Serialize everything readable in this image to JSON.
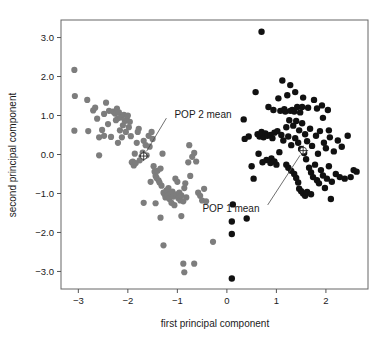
{
  "chart_data": {
    "type": "scatter",
    "title": "",
    "xlabel": "first principal component",
    "ylabel": "second principal component",
    "xlim": [
      -3.35,
      2.85
    ],
    "ylim": [
      -3.45,
      3.45
    ],
    "xticks": [
      -3,
      -2,
      -1,
      0,
      1,
      2
    ],
    "xticklabels": [
      "−3",
      "−2",
      "−1",
      "0",
      "1",
      "2"
    ],
    "yticks": [
      3.0,
      2.0,
      1.0,
      0.0,
      -1.0,
      -2.0,
      -3.0
    ],
    "yticklabels": [
      "3.0",
      "2.0",
      "1.0",
      "0.0",
      "−1.0",
      "−2.0",
      "−3.0"
    ],
    "grid": false,
    "legend": "none",
    "series": [
      {
        "name": "POP 2",
        "color": "#7d7d7d",
        "marker": "filled-circle",
        "marker_size": 4.0,
        "points": [
          [
            -3.08,
            2.17
          ],
          [
            -3.07,
            1.5
          ],
          [
            -3.08,
            0.61
          ],
          [
            -2.82,
            1.4
          ],
          [
            -2.8,
            0.6
          ],
          [
            -2.7,
            1.13
          ],
          [
            -2.66,
            1.2
          ],
          [
            -2.62,
            0.92
          ],
          [
            -2.58,
            0.44
          ],
          [
            -2.52,
            0.63
          ],
          [
            -2.48,
            1.04
          ],
          [
            -2.44,
            1.33
          ],
          [
            -2.4,
            0.78
          ],
          [
            -2.38,
            1.12
          ],
          [
            -2.34,
            0.45
          ],
          [
            -2.3,
            1.1
          ],
          [
            -2.26,
            1.05
          ],
          [
            -2.24,
            0.88
          ],
          [
            -2.22,
            1.18
          ],
          [
            -2.2,
            0.93
          ],
          [
            -2.18,
            1.08
          ],
          [
            -2.16,
            0.62
          ],
          [
            -2.14,
            0.95
          ],
          [
            -2.12,
            0.44
          ],
          [
            -2.1,
            0.75
          ],
          [
            -2.08,
            1.02
          ],
          [
            -2.06,
            0.86
          ],
          [
            -2.04,
            0.58
          ],
          [
            -2.02,
            0.9
          ],
          [
            -2.0,
            1.0
          ],
          [
            -1.98,
            0.7
          ],
          [
            -1.96,
            0.84
          ],
          [
            -1.94,
            0.47
          ],
          [
            -1.92,
            -0.2
          ],
          [
            -1.9,
            -0.18
          ],
          [
            -1.88,
            -0.28
          ],
          [
            -1.86,
            0.02
          ],
          [
            -1.84,
            -0.22
          ],
          [
            -1.82,
            0.3
          ],
          [
            -1.8,
            0.58
          ],
          [
            -1.78,
            0.66
          ],
          [
            -1.76,
            -0.15
          ],
          [
            -1.72,
            -0.05
          ],
          [
            -1.7,
            0.05
          ],
          [
            -1.68,
            0.35
          ],
          [
            -1.64,
            0.24
          ],
          [
            -1.62,
            -0.02
          ],
          [
            -1.58,
            0.48
          ],
          [
            -1.56,
            0.2
          ],
          [
            -1.52,
            0.58
          ],
          [
            -1.5,
            0.4
          ],
          [
            -1.48,
            -0.3
          ],
          [
            -1.46,
            -0.44
          ],
          [
            -1.44,
            -0.55
          ],
          [
            -1.42,
            -0.6
          ],
          [
            -1.4,
            -0.42
          ],
          [
            -1.38,
            -0.66
          ],
          [
            -1.36,
            -0.72
          ],
          [
            -1.34,
            -0.36
          ],
          [
            -1.32,
            -0.8
          ],
          [
            -1.3,
            0.02
          ],
          [
            -1.28,
            -0.98
          ],
          [
            -1.26,
            -1.02
          ],
          [
            -1.24,
            -1.1
          ],
          [
            -1.22,
            -0.92
          ],
          [
            -1.2,
            -1.05
          ],
          [
            -1.18,
            -0.86
          ],
          [
            -1.16,
            -1.14
          ],
          [
            -1.14,
            -1.0
          ],
          [
            -1.12,
            -1.24
          ],
          [
            -1.1,
            -0.95
          ],
          [
            -1.08,
            -1.08
          ],
          [
            -1.06,
            -1.3
          ],
          [
            -1.04,
            -0.62
          ],
          [
            -1.02,
            -1.02
          ],
          [
            -1.0,
            -0.7
          ],
          [
            -0.98,
            -1.12
          ],
          [
            -0.96,
            -0.98
          ],
          [
            -0.94,
            -1.18
          ],
          [
            -0.92,
            -1.05
          ],
          [
            -0.88,
            -1.2
          ],
          [
            -0.86,
            -0.86
          ],
          [
            -0.84,
            -0.74
          ],
          [
            -0.82,
            -1.1
          ],
          [
            -0.78,
            -0.2
          ],
          [
            -0.76,
            0.24
          ],
          [
            -0.74,
            -0.55
          ],
          [
            -0.7,
            -0.06
          ],
          [
            -0.66,
            0.04
          ],
          [
            -0.62,
            -0.18
          ],
          [
            -0.58,
            -0.98
          ],
          [
            -0.54,
            -1.06
          ],
          [
            -0.5,
            -1.18
          ],
          [
            -0.46,
            -0.88
          ],
          [
            -0.42,
            -1.2
          ],
          [
            -1.44,
            -1.25
          ],
          [
            -1.34,
            -1.62
          ],
          [
            -1.28,
            -2.33
          ],
          [
            -0.92,
            -1.58
          ],
          [
            -0.88,
            -2.8
          ],
          [
            -0.86,
            -3.02
          ],
          [
            -0.66,
            -2.8
          ],
          [
            -0.28,
            -2.24
          ],
          [
            -1.68,
            -1.24
          ],
          [
            -1.54,
            -0.7
          ],
          [
            -2.58,
            -0.02
          ],
          [
            -2.2,
            0.3
          ],
          [
            -2.48,
            0.48
          ]
        ]
      },
      {
        "name": "POP 1",
        "color": "#111111",
        "marker": "filled-circle",
        "marker_size": 4.2,
        "points": [
          [
            0.7,
            3.15
          ],
          [
            0.12,
            -1.28
          ],
          [
            0.1,
            -1.72
          ],
          [
            0.1,
            -2.04
          ],
          [
            0.1,
            -3.18
          ],
          [
            0.34,
            0.9
          ],
          [
            0.36,
            0.4
          ],
          [
            0.4,
            -1.64
          ],
          [
            0.44,
            0.46
          ],
          [
            0.5,
            -0.3
          ],
          [
            0.54,
            -0.62
          ],
          [
            0.58,
            1.6
          ],
          [
            0.62,
            0.52
          ],
          [
            0.66,
            0.46
          ],
          [
            0.7,
            0.58
          ],
          [
            0.74,
            0.44
          ],
          [
            0.78,
            0.54
          ],
          [
            0.82,
            0.48
          ],
          [
            0.84,
            1.22
          ],
          [
            0.88,
            0.5
          ],
          [
            0.9,
            -0.1
          ],
          [
            0.92,
            0.42
          ],
          [
            0.94,
            1.14
          ],
          [
            0.96,
            0.56
          ],
          [
            1.0,
            -0.26
          ],
          [
            1.02,
            0.6
          ],
          [
            1.04,
            1.44
          ],
          [
            1.06,
            0.06
          ],
          [
            1.08,
            1.12
          ],
          [
            1.1,
            0.5
          ],
          [
            1.12,
            1.9
          ],
          [
            1.14,
            0.36
          ],
          [
            1.16,
            1.16
          ],
          [
            1.18,
            1.1
          ],
          [
            1.2,
            0.7
          ],
          [
            1.22,
            1.52
          ],
          [
            1.24,
            0.46
          ],
          [
            1.26,
            0.88
          ],
          [
            1.28,
            1.12
          ],
          [
            1.3,
            0.24
          ],
          [
            1.32,
            1.14
          ],
          [
            1.34,
            0.74
          ],
          [
            1.36,
            1.1
          ],
          [
            1.38,
            0.42
          ],
          [
            1.4,
            0.86
          ],
          [
            1.42,
            1.22
          ],
          [
            1.44,
            0.3
          ],
          [
            1.46,
            0.62
          ],
          [
            1.48,
            1.08
          ],
          [
            1.5,
            0.14
          ],
          [
            1.52,
            0.8
          ],
          [
            1.54,
            1.46
          ],
          [
            1.56,
            0.04
          ],
          [
            1.58,
            0.52
          ],
          [
            1.6,
            -0.12
          ],
          [
            1.62,
            0.34
          ],
          [
            1.64,
            1.2
          ],
          [
            1.66,
            -0.34
          ],
          [
            1.68,
            0.66
          ],
          [
            1.7,
            -0.46
          ],
          [
            1.72,
            0.22
          ],
          [
            1.74,
            -0.58
          ],
          [
            1.76,
            1.4
          ],
          [
            1.78,
            -0.26
          ],
          [
            1.8,
            0.48
          ],
          [
            1.82,
            -0.66
          ],
          [
            1.84,
            0.02
          ],
          [
            1.86,
            -0.74
          ],
          [
            1.88,
            0.6
          ],
          [
            1.9,
            -0.4
          ],
          [
            1.92,
            1.26
          ],
          [
            1.94,
            -0.54
          ],
          [
            1.96,
            0.3
          ],
          [
            1.98,
            -0.86
          ],
          [
            2.0,
            0.16
          ],
          [
            2.02,
            -0.62
          ],
          [
            2.04,
            1.14
          ],
          [
            2.06,
            -0.3
          ],
          [
            2.08,
            0.44
          ],
          [
            2.1,
            -1.14
          ],
          [
            2.12,
            -0.7
          ],
          [
            2.16,
            0.08
          ],
          [
            2.2,
            -0.5
          ],
          [
            2.24,
            0.36
          ],
          [
            2.28,
            -0.58
          ],
          [
            2.32,
            0.2
          ],
          [
            2.38,
            -0.62
          ],
          [
            2.44,
            0.48
          ],
          [
            2.5,
            -0.58
          ],
          [
            2.56,
            -0.4
          ],
          [
            2.62,
            -0.44
          ],
          [
            1.46,
            -0.88
          ],
          [
            1.5,
            -0.94
          ],
          [
            1.54,
            -1.0
          ],
          [
            1.58,
            -1.06
          ],
          [
            1.44,
            -0.72
          ],
          [
            1.4,
            -0.6
          ],
          [
            1.36,
            -0.5
          ],
          [
            1.3,
            -0.42
          ],
          [
            1.24,
            -0.34
          ],
          [
            1.2,
            -0.26
          ],
          [
            0.96,
            -0.18
          ],
          [
            0.88,
            -0.22
          ],
          [
            0.8,
            -0.14
          ],
          [
            0.72,
            -0.2
          ],
          [
            0.64,
            0.02
          ],
          [
            1.62,
            -0.96
          ],
          [
            1.7,
            -1.02
          ],
          [
            1.28,
            1.78
          ],
          [
            1.38,
            1.6
          ],
          [
            1.52,
            1.22
          ],
          [
            1.82,
            1.18
          ],
          [
            1.94,
            0.94
          ],
          [
            2.06,
            0.62
          ]
        ]
      }
    ],
    "annotations": [
      {
        "label": "POP 2 mean",
        "mean_point": [
          -1.68,
          -0.04
        ],
        "text_x": -1.18,
        "text_y": 1.02,
        "marker": "circle-crosshair",
        "color": "#2a2a2a"
      },
      {
        "label": "POP 1 mean",
        "mean_point": [
          1.54,
          0.1
        ],
        "text_x": 0.78,
        "text_y": -1.38,
        "marker": "circle-crosshair",
        "color": "#2a2a2a"
      }
    ]
  },
  "colors": {
    "background": "#ffffff",
    "pop2_gray": "#7d7d7d",
    "pop1_black": "#111111",
    "frame": "#666666",
    "text": "#1a1a1a"
  }
}
